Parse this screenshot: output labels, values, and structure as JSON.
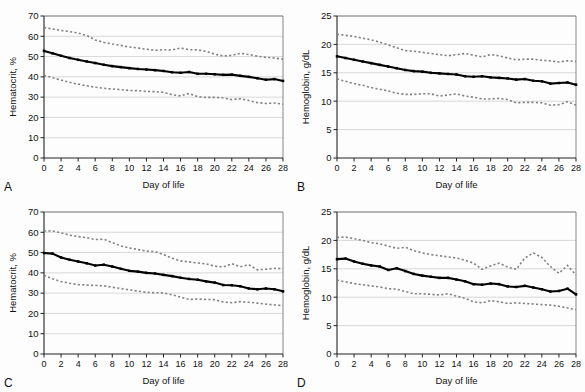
{
  "figure": {
    "panels": [
      {
        "letter": "A",
        "xlabel": "Day of life",
        "ylabel": "Hematocrit, %"
      },
      {
        "letter": "B",
        "xlabel": "Day of life",
        "ylabel": "Hemoglobin, g/dL"
      },
      {
        "letter": "C",
        "xlabel": "Day of life",
        "ylabel": "Hematocrit, %"
      },
      {
        "letter": "D",
        "xlabel": "Day of life",
        "ylabel": "Hemoglobin, g/dL"
      }
    ]
  },
  "chart_data": [
    {
      "type": "line",
      "panel": "A",
      "title": "",
      "xlabel": "Day of life",
      "ylabel": "Hematocrit, %",
      "xlim": [
        0,
        28
      ],
      "ylim": [
        0,
        70
      ],
      "xticks": [
        0,
        2,
        4,
        6,
        8,
        10,
        12,
        14,
        16,
        18,
        20,
        22,
        24,
        26,
        28
      ],
      "yticks": [
        0,
        10,
        20,
        30,
        40,
        50,
        60,
        70
      ],
      "grid": "horizontal",
      "legend": "none",
      "x": [
        0,
        1,
        2,
        3,
        4,
        5,
        6,
        7,
        8,
        9,
        10,
        11,
        12,
        13,
        14,
        15,
        16,
        17,
        18,
        19,
        20,
        21,
        22,
        23,
        24,
        25,
        26,
        27,
        28
      ],
      "series": [
        {
          "name": "Upper percentile",
          "style": "dotted",
          "color": "#808080",
          "values": [
            64.3,
            63.6,
            62.9,
            62.3,
            61.6,
            60.4,
            58.2,
            57.0,
            56.2,
            55.5,
            54.7,
            54.2,
            53.6,
            53.1,
            53.4,
            53.2,
            54.2,
            53.4,
            53.3,
            52.6,
            51.2,
            50.3,
            50.6,
            51.6,
            51.0,
            50.2,
            49.6,
            49.3,
            48.7
          ]
        },
        {
          "name": "Median",
          "style": "solid",
          "color": "#000000",
          "values": [
            52.8,
            51.6,
            50.4,
            49.3,
            48.4,
            47.6,
            46.8,
            46.0,
            45.3,
            44.8,
            44.3,
            43.9,
            43.6,
            43.3,
            42.9,
            42.3,
            42.0,
            42.4,
            41.5,
            41.5,
            41.3,
            41.0,
            41.1,
            40.5,
            40.0,
            39.3,
            38.6,
            38.9,
            38.0
          ]
        },
        {
          "name": "Lower percentile",
          "style": "dotted",
          "color": "#808080",
          "values": [
            40.7,
            39.6,
            38.4,
            37.3,
            36.4,
            35.6,
            34.9,
            34.4,
            34.0,
            33.7,
            33.3,
            33.2,
            32.8,
            32.7,
            32.4,
            31.2,
            30.6,
            31.8,
            30.2,
            29.9,
            29.9,
            29.6,
            28.8,
            29.2,
            28.3,
            27.3,
            26.9,
            27.1,
            26.5
          ]
        }
      ]
    },
    {
      "type": "line",
      "panel": "B",
      "title": "",
      "xlabel": "Day of life",
      "ylabel": "Hemoglobin, g/dL",
      "xlim": [
        0,
        28
      ],
      "ylim": [
        0,
        25
      ],
      "xticks": [
        0,
        2,
        4,
        6,
        8,
        10,
        12,
        14,
        16,
        18,
        20,
        22,
        24,
        26,
        28
      ],
      "yticks": [
        0,
        5,
        10,
        15,
        20,
        25
      ],
      "grid": "horizontal",
      "legend": "none",
      "x": [
        0,
        1,
        2,
        3,
        4,
        5,
        6,
        7,
        8,
        9,
        10,
        11,
        12,
        13,
        14,
        15,
        16,
        17,
        18,
        19,
        20,
        21,
        22,
        23,
        24,
        25,
        26,
        27,
        28
      ],
      "series": [
        {
          "name": "Upper percentile",
          "style": "dotted",
          "color": "#808080",
          "values": [
            21.8,
            21.6,
            21.4,
            21.1,
            20.8,
            20.4,
            19.9,
            19.4,
            18.9,
            18.8,
            18.6,
            18.4,
            18.2,
            18.0,
            18.2,
            18.4,
            18.1,
            17.8,
            18.2,
            18.0,
            17.6,
            17.3,
            17.4,
            17.4,
            17.2,
            17.1,
            16.9,
            17.1,
            17.0
          ]
        },
        {
          "name": "Median",
          "style": "solid",
          "color": "#000000",
          "values": [
            17.9,
            17.6,
            17.3,
            17.0,
            16.7,
            16.4,
            16.1,
            15.8,
            15.5,
            15.3,
            15.2,
            15.0,
            14.9,
            14.8,
            14.7,
            14.4,
            14.3,
            14.4,
            14.2,
            14.1,
            14.0,
            13.8,
            13.9,
            13.6,
            13.5,
            13.1,
            13.2,
            13.3,
            12.9
          ]
        },
        {
          "name": "Lower percentile",
          "style": "dotted",
          "color": "#808080",
          "values": [
            13.9,
            13.5,
            13.1,
            12.8,
            12.4,
            12.1,
            11.8,
            11.4,
            11.2,
            11.2,
            11.3,
            11.3,
            10.9,
            11.1,
            11.3,
            10.9,
            10.7,
            10.4,
            10.4,
            10.5,
            10.3,
            9.7,
            9.8,
            9.8,
            9.7,
            9.3,
            9.4,
            9.9,
            9.3
          ]
        }
      ]
    },
    {
      "type": "line",
      "panel": "C",
      "title": "",
      "xlabel": "Day of life",
      "ylabel": "Hematocrit, %",
      "xlim": [
        0,
        28
      ],
      "ylim": [
        0,
        70
      ],
      "xticks": [
        0,
        2,
        4,
        6,
        8,
        10,
        12,
        14,
        16,
        18,
        20,
        22,
        24,
        26,
        28
      ],
      "yticks": [
        0,
        10,
        20,
        30,
        40,
        50,
        60,
        70
      ],
      "grid": "horizontal",
      "legend": "none",
      "x": [
        0,
        1,
        2,
        3,
        4,
        5,
        6,
        7,
        8,
        9,
        10,
        11,
        12,
        13,
        14,
        15,
        16,
        17,
        18,
        19,
        20,
        21,
        22,
        23,
        24,
        25,
        26,
        27,
        28
      ],
      "series": [
        {
          "name": "Upper percentile",
          "style": "dotted",
          "color": "#808080",
          "values": [
            60.6,
            60.7,
            59.7,
            58.6,
            57.9,
            57.3,
            56.4,
            56.6,
            54.9,
            53.3,
            52.3,
            51.5,
            50.7,
            50.5,
            49.0,
            47.2,
            45.9,
            45.4,
            44.9,
            44.4,
            43.3,
            42.9,
            44.5,
            43.0,
            44.0,
            41.5,
            41.8,
            42.2,
            42.0
          ]
        },
        {
          "name": "Median",
          "style": "solid",
          "color": "#000000",
          "values": [
            49.8,
            49.5,
            47.6,
            46.5,
            45.6,
            44.7,
            43.6,
            44.0,
            43.1,
            42.0,
            41.0,
            40.6,
            40.0,
            39.7,
            39.0,
            38.4,
            37.6,
            37.0,
            36.6,
            35.8,
            35.2,
            34.0,
            33.9,
            33.4,
            32.3,
            31.9,
            32.3,
            31.9,
            30.9
          ]
        },
        {
          "name": "Lower percentile",
          "style": "dotted",
          "color": "#808080",
          "values": [
            38.8,
            37.1,
            35.7,
            34.9,
            34.2,
            34.0,
            33.8,
            33.6,
            32.9,
            32.3,
            31.6,
            31.0,
            30.4,
            30.2,
            30.1,
            29.2,
            28.0,
            26.9,
            27.1,
            26.9,
            26.8,
            25.6,
            25.3,
            25.8,
            25.5,
            25.1,
            24.6,
            24.2,
            23.9
          ]
        }
      ]
    },
    {
      "type": "line",
      "panel": "D",
      "title": "",
      "xlabel": "Day of life",
      "ylabel": "Hemoglobin, g/dL",
      "xlim": [
        0,
        28
      ],
      "ylim": [
        0,
        25
      ],
      "xticks": [
        0,
        2,
        4,
        6,
        8,
        10,
        12,
        14,
        16,
        18,
        20,
        22,
        24,
        26,
        28
      ],
      "yticks": [
        0,
        5,
        10,
        15,
        20,
        25
      ],
      "grid": "horizontal",
      "legend": "none",
      "x": [
        0,
        1,
        2,
        3,
        4,
        5,
        6,
        7,
        8,
        9,
        10,
        11,
        12,
        13,
        14,
        15,
        16,
        17,
        18,
        19,
        20,
        21,
        22,
        23,
        24,
        25,
        26,
        27,
        28
      ],
      "series": [
        {
          "name": "Upper percentile",
          "style": "dotted",
          "color": "#808080",
          "values": [
            20.5,
            20.6,
            20.3,
            20.0,
            19.6,
            19.4,
            19.0,
            18.6,
            18.8,
            18.2,
            17.8,
            17.5,
            17.3,
            17.1,
            16.9,
            16.5,
            16.0,
            14.9,
            15.5,
            16.0,
            15.3,
            14.9,
            16.9,
            17.8,
            17.0,
            15.4,
            14.2,
            15.6,
            13.9
          ]
        },
        {
          "name": "Median",
          "style": "solid",
          "color": "#000000",
          "values": [
            16.7,
            16.8,
            16.3,
            15.9,
            15.6,
            15.4,
            14.8,
            15.1,
            14.6,
            14.1,
            13.8,
            13.6,
            13.4,
            13.4,
            13.1,
            12.8,
            12.3,
            12.2,
            12.4,
            12.3,
            11.9,
            11.8,
            12.0,
            11.7,
            11.4,
            11.0,
            11.1,
            11.5,
            10.5
          ]
        },
        {
          "name": "Lower percentile",
          "style": "dotted",
          "color": "#808080",
          "values": [
            13.0,
            12.7,
            12.4,
            12.2,
            12.0,
            11.8,
            11.5,
            11.4,
            11.0,
            10.6,
            10.6,
            10.5,
            10.4,
            10.6,
            10.2,
            9.8,
            9.2,
            9.0,
            9.4,
            9.2,
            8.9,
            9.0,
            8.9,
            8.8,
            8.7,
            8.6,
            8.4,
            8.1,
            7.8
          ]
        }
      ]
    }
  ]
}
